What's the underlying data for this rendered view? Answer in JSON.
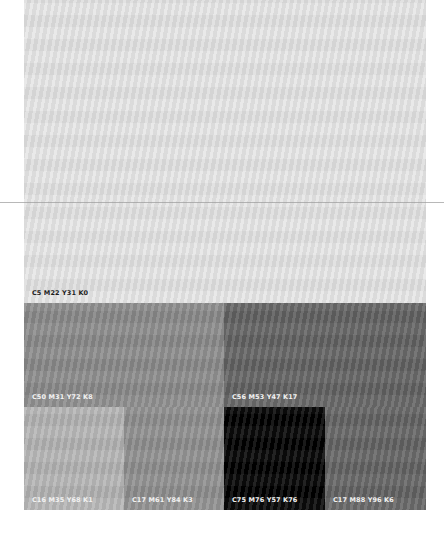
{
  "palette": {
    "swatches": [
      {
        "label": "C5 M22 Y31 K0",
        "color": "#e6e6e6",
        "text_color": "dark"
      },
      {
        "label": "C50 M31 Y72 K8",
        "color": "#8a8a8a",
        "text_color": "light"
      },
      {
        "label": "C56 M53 Y47 K17",
        "color": "#626262",
        "text_color": "light"
      },
      {
        "label": "C16 M35 Y68 K1",
        "color": "#b4b4b4",
        "text_color": "light"
      },
      {
        "label": "C17 M61 Y84 K3",
        "color": "#8e8e8e",
        "text_color": "light"
      },
      {
        "label": "C75 M76 Y57 K76",
        "color": "#000000",
        "text_color": "light"
      },
      {
        "label": "C17 M88 Y96 K6",
        "color": "#636363",
        "text_color": "light"
      }
    ]
  }
}
